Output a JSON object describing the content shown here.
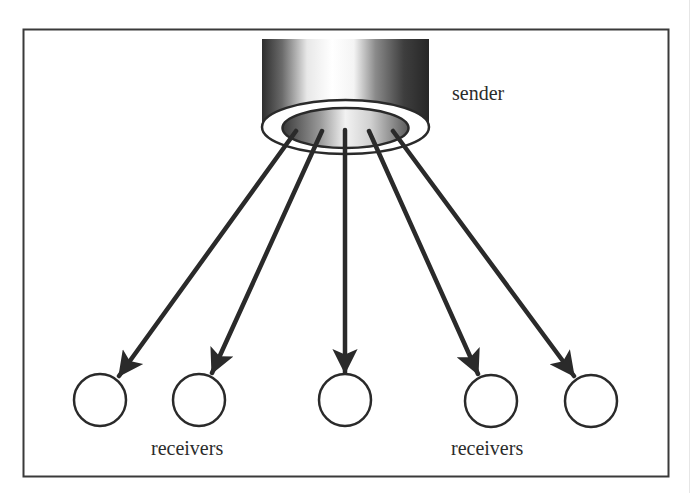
{
  "diagram": {
    "type": "multicast",
    "frame": {
      "x": 23,
      "y": 29,
      "width": 645,
      "height": 447,
      "stroke": "#3a3a3a"
    },
    "sender": {
      "label": "sender",
      "label_pos": {
        "x": 452,
        "y": 100
      },
      "cylinder": {
        "x": 262,
        "top": 39,
        "width": 167,
        "bottom": 127
      },
      "outer_ellipse": {
        "cx": 345.5,
        "cy": 127,
        "rx": 83.5,
        "ry": 27
      },
      "inner_ellipse": {
        "cx": 345.5,
        "cy": 128,
        "rx": 63,
        "ry": 20
      }
    },
    "receivers": [
      {
        "id": "r1",
        "cx": 100,
        "cy": 400,
        "r": 26
      },
      {
        "id": "r2",
        "cx": 199,
        "cy": 400,
        "r": 26
      },
      {
        "id": "r3",
        "cx": 345,
        "cy": 400,
        "r": 26
      },
      {
        "id": "r4",
        "cx": 491,
        "cy": 401,
        "r": 26
      },
      {
        "id": "r5",
        "cx": 591,
        "cy": 401,
        "r": 26
      }
    ],
    "receiver_labels": [
      {
        "text": "receivers",
        "x": 151,
        "y": 455
      },
      {
        "text": "receivers",
        "x": 451,
        "y": 455
      }
    ],
    "arrows": [
      {
        "from": [
          296,
          131
        ],
        "to": [
          119,
          376
        ]
      },
      {
        "from": [
          322,
          131
        ],
        "to": [
          212,
          373
        ]
      },
      {
        "from": [
          345,
          130
        ],
        "to": [
          345,
          373
        ]
      },
      {
        "from": [
          369,
          131
        ],
        "to": [
          478,
          374
        ]
      },
      {
        "from": [
          393,
          131
        ],
        "to": [
          574,
          376
        ]
      }
    ],
    "colors": {
      "ink": "#2a2a2a",
      "circle_stroke": "#2a2a2a",
      "background": "#ffffff"
    }
  }
}
